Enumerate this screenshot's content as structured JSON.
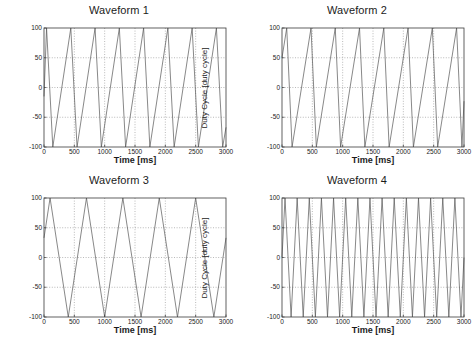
{
  "figure": {
    "background": "#ffffff",
    "axis_color": "#3a3a3a",
    "grid_color": "#8a8a8a",
    "line_color": "#555555",
    "rows": 2,
    "cols": 2
  },
  "chart_data": [
    {
      "type": "line",
      "title": "Waveform 1",
      "xlabel": "Time [ms]",
      "ylabel": "Duty Cycle [duty cycle]",
      "xlim": [
        0,
        3000
      ],
      "ylim": [
        -100,
        100
      ],
      "xticks": [
        0,
        500,
        1000,
        1500,
        2000,
        2500,
        3000
      ],
      "xtick_labels": [
        "0",
        "500",
        "1000",
        "1500",
        "2000",
        "2500",
        "3000"
      ],
      "yticks": [
        -100,
        -50,
        0,
        50,
        100
      ],
      "ytick_labels": [
        "-100",
        "-50",
        "0",
        "50",
        "100"
      ],
      "grid": true,
      "legend": null,
      "waveform": "asymmetric-triangle",
      "period_ms": 400,
      "rise_fraction": 0.18,
      "phase_ms": 30,
      "amplitude": 100,
      "offset": 0,
      "x": [
        0,
        42,
        145,
        442,
        545,
        842,
        945,
        1242,
        1345,
        1642,
        1745,
        2042,
        2145,
        2442,
        2545,
        2842,
        2945,
        3000
      ],
      "y": [
        -15,
        100,
        -100,
        100,
        -100,
        100,
        -100,
        100,
        -100,
        100,
        -100,
        100,
        -100,
        100,
        -100,
        100,
        -100,
        -67
      ]
    },
    {
      "type": "line",
      "title": "Waveform 2",
      "xlabel": "Time [ms]",
      "ylabel": "Duty Cycle [duty cycle]",
      "xlim": [
        0,
        3000
      ],
      "ylim": [
        -100,
        100
      ],
      "xticks": [
        0,
        500,
        1000,
        1500,
        2000,
        2500,
        3000
      ],
      "xtick_labels": [
        "0",
        "500",
        "1000",
        "1500",
        "2000",
        "2500",
        "3000"
      ],
      "yticks": [
        -100,
        -50,
        0,
        50,
        100
      ],
      "ytick_labels": [
        "-100",
        "-50",
        "0",
        "50",
        "100"
      ],
      "grid": true,
      "legend": null,
      "waveform": "asymmetric-triangle",
      "period_ms": 400,
      "rise_fraction": 0.78,
      "phase_ms": 312,
      "amplitude": 100,
      "offset": 0,
      "x": [
        0,
        78,
        166,
        478,
        566,
        878,
        966,
        1278,
        1366,
        1678,
        1766,
        2078,
        2166,
        2478,
        2566,
        2878,
        2966,
        3000
      ],
      "y": [
        50,
        100,
        -100,
        100,
        -100,
        100,
        -100,
        100,
        -100,
        100,
        -100,
        100,
        -100,
        100,
        -100,
        100,
        -100,
        -23
      ]
    },
    {
      "type": "line",
      "title": "Waveform 3",
      "xlabel": "Time [ms]",
      "ylabel": "Duty Cycle [duty cycle]",
      "xlim": [
        0,
        3000
      ],
      "ylim": [
        -100,
        100
      ],
      "xticks": [
        0,
        500,
        1000,
        1500,
        2000,
        2500,
        3000
      ],
      "xtick_labels": [
        "0",
        "500",
        "1000",
        "1500",
        "2000",
        "2500",
        "3000"
      ],
      "yticks": [
        -100,
        -50,
        0,
        50,
        100
      ],
      "ytick_labels": [
        "-100",
        "-50",
        "0",
        "50",
        "100"
      ],
      "grid": true,
      "legend": null,
      "waveform": "symmetric-triangle",
      "period_ms": 600,
      "rise_fraction": 0.5,
      "phase_ms": 100,
      "amplitude": 100,
      "offset": 0,
      "x": [
        0,
        100,
        400,
        700,
        1000,
        1300,
        1600,
        1900,
        2200,
        2500,
        2800,
        3000
      ],
      "y": [
        33,
        100,
        -100,
        100,
        -100,
        100,
        -100,
        100,
        -100,
        100,
        -100,
        33
      ]
    },
    {
      "type": "line",
      "title": "Waveform 4",
      "xlabel": "Time [ms]",
      "ylabel": "Duty Cycle [duty cycle]",
      "xlim": [
        0,
        3000
      ],
      "ylim": [
        -100,
        100
      ],
      "xticks": [
        0,
        500,
        1000,
        1500,
        2000,
        2500,
        3000
      ],
      "xtick_labels": [
        "0",
        "500",
        "1000",
        "1500",
        "2000",
        "2500",
        "3000"
      ],
      "yticks": [
        -100,
        -50,
        0,
        50,
        100
      ],
      "ytick_labels": [
        "-100",
        "-50",
        "0",
        "50",
        "100"
      ],
      "grid": true,
      "legend": null,
      "waveform": "symmetric-triangle",
      "period_ms": 200,
      "rise_fraction": 0.5,
      "phase_ms": 50,
      "amplitude": 100,
      "offset": 0,
      "x": [
        0,
        50,
        150,
        250,
        350,
        450,
        550,
        650,
        750,
        850,
        950,
        1050,
        1150,
        1250,
        1350,
        1450,
        1550,
        1650,
        1750,
        1850,
        1950,
        2050,
        2150,
        2250,
        2350,
        2450,
        2550,
        2650,
        2750,
        2850,
        2950,
        3000
      ],
      "y": [
        0,
        100,
        -100,
        100,
        -100,
        100,
        -100,
        100,
        -100,
        100,
        -100,
        100,
        -100,
        100,
        -100,
        100,
        -100,
        100,
        -100,
        100,
        -100,
        100,
        -100,
        100,
        -100,
        100,
        -100,
        100,
        -100,
        100,
        -100,
        0
      ]
    }
  ]
}
